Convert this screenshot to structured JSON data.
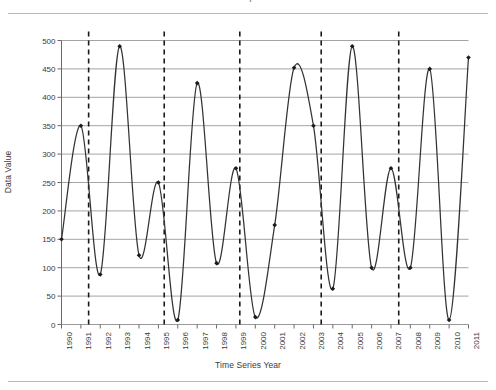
{
  "figure": {
    "clipped_caption_fragment": "T",
    "background_color": "#ffffff",
    "rule_color": "#b9b9b9"
  },
  "chart_data": {
    "type": "line",
    "title": "",
    "subtitle": "",
    "xlabel": "Time Series Year",
    "ylabel": "Data Value",
    "xlim": [
      1990,
      2011
    ],
    "ylim": [
      0,
      500
    ],
    "ytick_step": 50,
    "grid": "horizontal",
    "legend": "none",
    "line_color": "#333333",
    "grid_color": "#9a9a9a",
    "marker": "diamond",
    "marker_color": "#1a1a1a",
    "interpolation": "smooth-spline",
    "x": [
      1990,
      1991,
      1992,
      1993,
      1994,
      1995,
      1996,
      1997,
      1998,
      1999,
      2000,
      2001,
      2002,
      2003,
      2004,
      2005,
      2006,
      2007,
      2008,
      2009,
      2010,
      2011
    ],
    "values": [
      150,
      350,
      88,
      490,
      122,
      250,
      8,
      425,
      108,
      275,
      13,
      175,
      452,
      350,
      63,
      490,
      100,
      275,
      100,
      450,
      8,
      470
    ],
    "xticks": [
      "1990",
      "1991",
      "1992",
      "1993",
      "1994",
      "1995",
      "1996",
      "1997",
      "1998",
      "1999",
      "2000",
      "2001",
      "2002",
      "2003",
      "2004",
      "2005",
      "2006",
      "2007",
      "2008",
      "2009",
      "2010",
      "2011"
    ],
    "yticks": [
      "0",
      "50",
      "100",
      "150",
      "200",
      "250",
      "300",
      "350",
      "400",
      "450",
      "500"
    ],
    "reference_lines": {
      "style": "dashed-vertical",
      "color": "#1a1a1a",
      "x_positions": [
        1991.4,
        1995.3,
        1999.2,
        2003.4,
        2007.4
      ]
    },
    "annotations": []
  }
}
